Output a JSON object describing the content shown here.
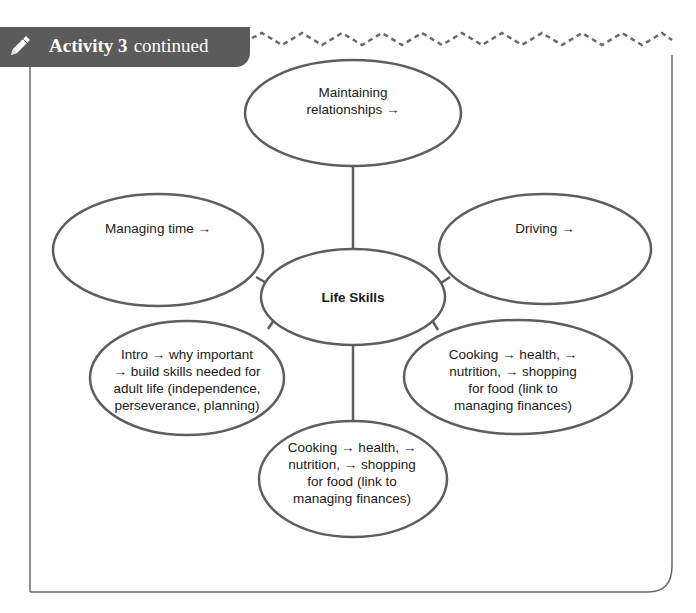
{
  "header": {
    "icon": "pencil-icon",
    "activity_label": "Activity 3",
    "suffix": "continued",
    "background_color": "#5b5b5b",
    "text_color": "#ffffff"
  },
  "diagram": {
    "line_color": "#5e5e5e",
    "center": {
      "label": "Life Skills"
    },
    "nodes": [
      {
        "id": "top",
        "label": "Maintaining relationships →",
        "lines": [
          "Maintaining",
          "relationships →"
        ]
      },
      {
        "id": "left",
        "label": "Managing time →",
        "lines": [
          "Managing time →"
        ]
      },
      {
        "id": "right",
        "label": "Driving →",
        "lines": [
          "Driving →"
        ]
      },
      {
        "id": "bottom-left",
        "label": "Intro → why important → build skills needed for adult life (independence, perseverance, planning)",
        "lines": [
          "Intro → why important",
          "→ build skills needed for",
          "adult life (independence,",
          "perseverance, planning)"
        ]
      },
      {
        "id": "bottom-right",
        "label": "Cooking → health, → nutrition, → shopping for food (link to managing finances)",
        "lines": [
          "Cooking → health, →",
          "nutrition, → shopping",
          "for food (link to",
          "managing finances)"
        ]
      },
      {
        "id": "bottom",
        "label": "Cooking → health, → nutrition, → shopping for food (link to managing finances)",
        "lines": [
          "Cooking → health, →",
          "nutrition, → shopping",
          "for food (link to",
          "managing finances)"
        ]
      }
    ]
  }
}
